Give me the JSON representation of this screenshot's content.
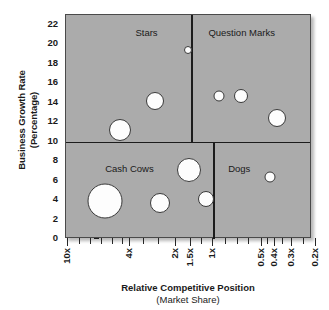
{
  "chart_data": {
    "type": "scatter",
    "title": "",
    "xlabel": "Relative Competitive Position",
    "xlabel_sub": "(Market Share)",
    "ylabel": "Business Growth Rate",
    "ylabel_sub": "(Percentage)",
    "grid": false,
    "legend": "none",
    "background_color": "#ababab",
    "bubble_color": "#fdfdfd",
    "bubble_border_color": "#3a3a3a",
    "ylim": [
      0,
      23
    ],
    "y_ticks": [
      0,
      2,
      4,
      6,
      8,
      10,
      12,
      14,
      16,
      18,
      20,
      22
    ],
    "x_scale": "log-descending",
    "x_ticks": [
      "10x",
      "4x",
      "2x",
      "1.5x",
      "1x",
      "0.5x",
      "0.4x",
      "0.3x",
      "0.2x",
      "0.1x"
    ],
    "x_tick_positions_px": [
      2,
      64,
      110,
      125,
      147,
      196,
      209,
      226,
      250,
      292
    ],
    "x_minor_tick_positions_px": [
      14,
      25,
      36,
      47,
      57,
      78,
      93,
      136,
      160,
      172,
      183,
      202,
      217,
      238,
      268
    ],
    "divider_growth_rate": 10,
    "divider_share_top": "1.5x",
    "divider_share_bottom": "1x",
    "quadrants": [
      {
        "name": "stars",
        "label": "Stars",
        "cx_pct": 33,
        "y_px": 12
      },
      {
        "name": "question-marks",
        "label": "Question Marks",
        "cx_pct": 72,
        "y_px": 12
      },
      {
        "name": "cash-cows",
        "label": "Cash Cows",
        "cx_pct": 26,
        "y_px": 148
      },
      {
        "name": "dogs",
        "label": "Dogs",
        "cx_pct": 71,
        "y_px": 148
      }
    ],
    "points": [
      {
        "quadrant": "stars",
        "share": "2.6x",
        "growth": 11.6,
        "size": 22,
        "x_px": 54,
        "y_px": 115
      },
      {
        "quadrant": "stars",
        "share": "1.9x",
        "growth": 14.6,
        "size": 18,
        "x_px": 89,
        "y_px": 86
      },
      {
        "quadrant": "question-marks",
        "share": "0.95x",
        "growth": 20.3,
        "size": 8,
        "x_px": 122,
        "y_px": 35
      },
      {
        "quadrant": "question-marks",
        "share": "0.62x",
        "growth": 15.6,
        "size": 11,
        "x_px": 153,
        "y_px": 81
      },
      {
        "quadrant": "question-marks",
        "share": "0.5x",
        "growth": 15.6,
        "size": 14,
        "x_px": 175,
        "y_px": 81
      },
      {
        "quadrant": "question-marks",
        "share": "0.35x",
        "growth": 13.3,
        "size": 18,
        "x_px": 211,
        "y_px": 103
      },
      {
        "quadrant": "cash-cows",
        "share": "3.2x",
        "growth": 3.6,
        "size": 35,
        "x_px": 39,
        "y_px": 186
      },
      {
        "quadrant": "cash-cows",
        "share": "1.8x",
        "growth": 3.4,
        "size": 20,
        "x_px": 94,
        "y_px": 188
      },
      {
        "quadrant": "cash-cows",
        "share": "1.4x",
        "growth": 6.8,
        "size": 24,
        "x_px": 123,
        "y_px": 155
      },
      {
        "quadrant": "dogs",
        "share": "0.8x",
        "growth": 3.8,
        "size": 16,
        "x_px": 140,
        "y_px": 184
      },
      {
        "quadrant": "dogs",
        "share": "0.37x",
        "growth": 6.1,
        "size": 11,
        "x_px": 204,
        "y_px": 162
      },
      {
        "quadrant": "dogs",
        "share": "0.15x",
        "growth": 7.1,
        "size": 9,
        "x_px": 273,
        "y_px": 153
      }
    ]
  }
}
